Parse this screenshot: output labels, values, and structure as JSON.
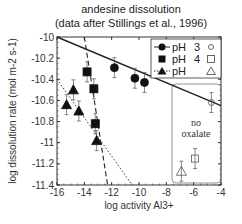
{
  "chart_data": {
    "type": "scatter",
    "title": "andesine dissolution",
    "subtitle": "(data after Stillings et al., 1996)",
    "xlabel": "log activity Al3+",
    "ylabel": "log dissolution rate (mol m-2 s-1)",
    "xlim": [
      -16,
      -4
    ],
    "ylim": [
      -11.4,
      -10
    ],
    "xticks": [
      -16,
      -14,
      -12,
      -10,
      -8,
      -6,
      -4
    ],
    "yticks": [
      -10,
      -10.2,
      -10.4,
      -10.6,
      -10.8,
      -11,
      -11.2,
      -11.4
    ],
    "legend": {
      "position": "upper right",
      "entries": [
        {
          "label": "pH",
          "value": "3",
          "marker": "filled-circle",
          "open_marker": "open-circle",
          "line": "solid"
        },
        {
          "label": "pH",
          "value": "4",
          "marker": "filled-square",
          "open_marker": "open-square",
          "line": "none"
        },
        {
          "label": "pH",
          "value": "",
          "marker": "filled-triangle",
          "open_marker": "open-triangle",
          "line": "dotted"
        }
      ]
    },
    "annotation": {
      "text_line1": "no",
      "text_line2": "oxalate"
    },
    "series": [
      {
        "name": "pH 3",
        "marker": "filled-circle",
        "x": [
          -11.8,
          -10.3,
          -9.6
        ],
        "y": [
          -10.29,
          -10.39,
          -10.43
        ]
      },
      {
        "name": "pH 4",
        "marker": "filled-square",
        "x": [
          -13.8,
          -13.3,
          -13.2
        ],
        "y": [
          -10.33,
          -10.49,
          -10.82
        ]
      },
      {
        "name": "pH (triangle)",
        "marker": "filled-triangle",
        "x": [
          -15.3,
          -14.8,
          -14.4,
          -13.1
        ],
        "y": [
          -10.64,
          -10.5,
          -10.7,
          -10.98
        ]
      },
      {
        "name": "pH 3 no oxalate",
        "marker": "open-circle",
        "x": [
          -4.7
        ],
        "y": [
          -10.62
        ]
      },
      {
        "name": "pH 4 no oxalate",
        "marker": "open-square",
        "x": [
          -5.9
        ],
        "y": [
          -11.15
        ]
      },
      {
        "name": "triangle no oxalate",
        "marker": "open-triangle",
        "x": [
          -6.9
        ],
        "y": [
          -11.27
        ]
      }
    ],
    "fit_lines": [
      {
        "style": "solid",
        "from": [
          -16,
          -10.0
        ],
        "to": [
          -4,
          -10.65
        ]
      },
      {
        "style": "dashed",
        "from": [
          -14.0,
          -10.0
        ],
        "to": [
          -12.3,
          -11.4
        ]
      },
      {
        "style": "dotted",
        "from": [
          -16,
          -10.4
        ],
        "to": [
          -10.5,
          -11.4
        ]
      }
    ]
  }
}
